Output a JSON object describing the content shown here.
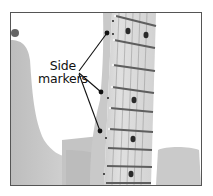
{
  "figure": {
    "annotation": {
      "line1": "Side",
      "line2": "markers"
    },
    "colors": {
      "frame": "#555555",
      "background": "#ffffff",
      "body": "#c8c8c8",
      "neck": "#d6d6d6",
      "fret": "#6a6a6a",
      "dot": "#1a1a1a"
    }
  }
}
